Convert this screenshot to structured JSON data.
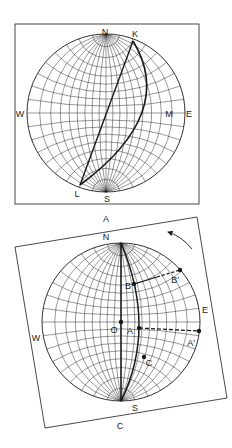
{
  "colors": {
    "ink": "#1a1a1a",
    "grid": "#333333",
    "background": "#ffffff"
  },
  "panel_a": {
    "caption": "A",
    "frame": {
      "x": 15,
      "y": 24,
      "w": 184,
      "h": 180
    },
    "net": {
      "cx": 106,
      "cy": 113,
      "r": 79,
      "step_deg": 10
    },
    "labels": [
      {
        "id": "N",
        "text": "N",
        "x": 105,
        "y": 35
      },
      {
        "id": "K",
        "text": "K",
        "x": 135,
        "y": 37
      },
      {
        "id": "W",
        "text": "W",
        "x": 20,
        "y": 117
      },
      {
        "id": "M",
        "text": "M",
        "x": 169,
        "y": 117
      },
      {
        "id": "E",
        "text": "E",
        "x": 189,
        "y": 117
      },
      {
        "id": "L",
        "text": "L",
        "x": 77,
        "y": 197
      },
      {
        "id": "S",
        "text": "S",
        "x": 107,
        "y": 202
      }
    ],
    "points": {
      "K": [
        133,
        41
      ],
      "L": [
        80,
        185
      ],
      "M": [
        155,
        113
      ]
    },
    "caption_pos": {
      "x": 106,
      "y": 222
    }
  },
  "panel_c": {
    "caption": "C",
    "frame_corners": [
      [
        15,
        247
      ],
      [
        197,
        217
      ],
      [
        227,
        398
      ],
      [
        45,
        428
      ]
    ],
    "net": {
      "cx": 121,
      "cy": 322,
      "r": 79,
      "step_deg": 10
    },
    "labels": [
      {
        "id": "N",
        "text": "N",
        "x": 106,
        "y": 240
      },
      {
        "id": "E",
        "text": "E",
        "x": 205,
        "y": 313
      },
      {
        "id": "W",
        "text": "W",
        "x": 36,
        "y": 341
      },
      {
        "id": "S",
        "text": "S",
        "x": 135,
        "y": 411
      },
      {
        "id": "O",
        "text": "O",
        "x": 114,
        "y": 333
      },
      {
        "id": "A",
        "text": "A",
        "x": 130,
        "y": 334
      },
      {
        "id": "A_prime",
        "text": "A'",
        "x": 191,
        "y": 346
      },
      {
        "id": "B",
        "text": "B",
        "x": 128,
        "y": 289
      },
      {
        "id": "B_prime",
        "text": "B'",
        "x": 175,
        "y": 283
      },
      {
        "id": "C",
        "text": "C",
        "x": 149,
        "y": 366
      }
    ],
    "points": {
      "O": [
        121,
        322
      ],
      "A": [
        139,
        328
      ],
      "A_prime": [
        199,
        331
      ],
      "B": [
        134,
        284
      ],
      "B_prime": [
        180,
        270
      ],
      "C": [
        144,
        357
      ]
    },
    "rotation_arrow": {
      "from": [
        192,
        249
      ],
      "to": [
        168,
        232
      ]
    },
    "caption_pos": {
      "x": 120,
      "y": 429
    }
  }
}
